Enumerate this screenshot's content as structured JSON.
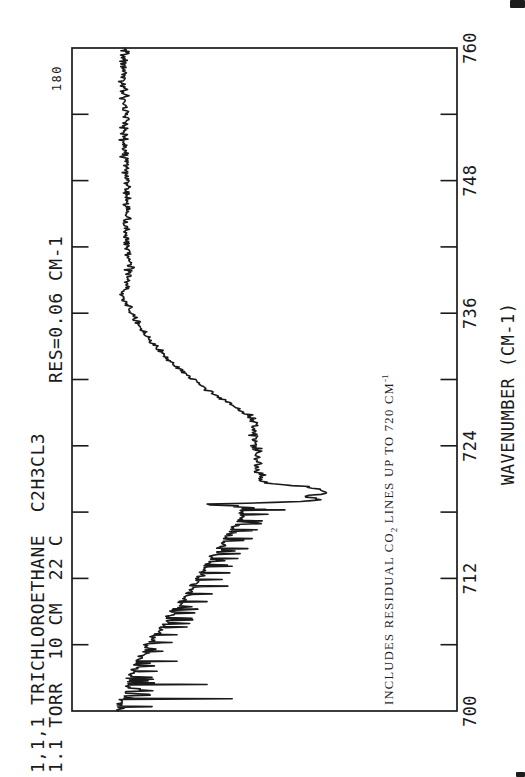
{
  "page": {
    "paper_color": "#ffffff",
    "ink_color": "#1a1a1a",
    "page_number": "180",
    "orientation_note": "landscape spectrum rotated 90deg CCW on portrait page"
  },
  "header": {
    "line1": "1,1,1 TRICHLOROETHANE  C2H3CL3",
    "line2": "1.1 TORR  10 CM  22 C",
    "resolution": "RES=0.06 CM-1"
  },
  "axis": {
    "label": "WAVENUMBER (CM-1)"
  },
  "annotation": {
    "pre": "INCLUDES RESIDUAL CO",
    "sub": "2",
    "mid": " LINES UP TO 720 CM",
    "sup": "-1"
  },
  "chart_data": {
    "type": "line",
    "xlabel": "WAVENUMBER (CM-1)",
    "xlim": [
      700,
      760
    ],
    "x_major_ticks": [
      700,
      712,
      724,
      736,
      748,
      760
    ],
    "x_minor_tick_step": 6,
    "ylabel": "transmittance (unlabeled); depth 0 = top of frame, 1 = bottom of frame",
    "frame": "full rectangle, inward ticks on top and bottom edges",
    "band_center_cm1": 719.9,
    "envelope_w_depth": [
      [
        700.0,
        0.125
      ],
      [
        700.4,
        0.127
      ],
      [
        701.0,
        0.133
      ],
      [
        701.8,
        0.14
      ],
      [
        702.6,
        0.148
      ],
      [
        703.4,
        0.158
      ],
      [
        704.2,
        0.169
      ],
      [
        705.0,
        0.182
      ],
      [
        705.8,
        0.197
      ],
      [
        706.6,
        0.213
      ],
      [
        707.4,
        0.231
      ],
      [
        708.2,
        0.249
      ],
      [
        709.0,
        0.265
      ],
      [
        709.8,
        0.283
      ],
      [
        710.6,
        0.301
      ],
      [
        711.4,
        0.317
      ],
      [
        712.2,
        0.332
      ],
      [
        713.0,
        0.348
      ],
      [
        713.8,
        0.364
      ],
      [
        714.6,
        0.384
      ],
      [
        715.4,
        0.397
      ],
      [
        716.2,
        0.413
      ],
      [
        717.0,
        0.429
      ],
      [
        717.6,
        0.442
      ],
      [
        718.1,
        0.448
      ],
      [
        718.45,
        0.43
      ],
      [
        718.7,
        0.33
      ],
      [
        718.85,
        0.5
      ],
      [
        719.0,
        0.62
      ],
      [
        719.15,
        0.645
      ],
      [
        719.4,
        0.61
      ],
      [
        719.6,
        0.655
      ],
      [
        719.8,
        0.64
      ],
      [
        719.95,
        0.66
      ],
      [
        720.1,
        0.64
      ],
      [
        720.35,
        0.6
      ],
      [
        720.6,
        0.51
      ],
      [
        720.9,
        0.496
      ],
      [
        721.6,
        0.486
      ],
      [
        722.5,
        0.478
      ],
      [
        723.5,
        0.481
      ],
      [
        724.5,
        0.473
      ],
      [
        725.5,
        0.475
      ],
      [
        726.3,
        0.468
      ],
      [
        727.1,
        0.444
      ],
      [
        728.0,
        0.4
      ],
      [
        728.9,
        0.358
      ],
      [
        729.8,
        0.322
      ],
      [
        730.7,
        0.291
      ],
      [
        731.6,
        0.257
      ],
      [
        732.5,
        0.231
      ],
      [
        733.5,
        0.205
      ],
      [
        734.4,
        0.182
      ],
      [
        735.3,
        0.169
      ],
      [
        736.2,
        0.151
      ],
      [
        737.0,
        0.14
      ],
      [
        737.5,
        0.13
      ],
      [
        738.5,
        0.145
      ],
      [
        740.0,
        0.151
      ],
      [
        742.0,
        0.145
      ],
      [
        745.0,
        0.14
      ],
      [
        748.0,
        0.143
      ],
      [
        751.0,
        0.135
      ],
      [
        754.0,
        0.14
      ],
      [
        757.0,
        0.133
      ],
      [
        760.0,
        0.14
      ]
    ],
    "co2_spikes_w_depth": [
      [
        718.2,
        0.553
      ],
      [
        717.8,
        0.509
      ],
      [
        717.2,
        0.494
      ],
      [
        716.4,
        0.481
      ],
      [
        715.6,
        0.468
      ],
      [
        714.7,
        0.457
      ],
      [
        713.8,
        0.431
      ],
      [
        713.1,
        0.416
      ],
      [
        712.5,
        0.41
      ],
      [
        711.9,
        0.39
      ],
      [
        711.3,
        0.405
      ],
      [
        710.6,
        0.364
      ],
      [
        709.9,
        0.351
      ],
      [
        709.2,
        0.325
      ],
      [
        708.4,
        0.312
      ],
      [
        707.6,
        0.299
      ],
      [
        706.9,
        0.273
      ],
      [
        706.2,
        0.26
      ],
      [
        705.4,
        0.236
      ],
      [
        704.5,
        0.273
      ],
      [
        703.6,
        0.221
      ],
      [
        702.4,
        0.351
      ],
      [
        701.1,
        0.416
      ],
      [
        700.4,
        0.208
      ]
    ],
    "noise_sigma_depth": {
      "baseline_738_760": 0.011,
      "slope_727_738": 0.008,
      "plateau_720p4_727": 0.013,
      "qbranch_719_720p4": 0.018,
      "co2_region_700_719": 0.012
    },
    "random_minor_spikes": {
      "region": [
        700.3,
        718.6
      ],
      "probability": 0.14,
      "extra_depth": [
        0.02,
        0.07
      ]
    }
  }
}
